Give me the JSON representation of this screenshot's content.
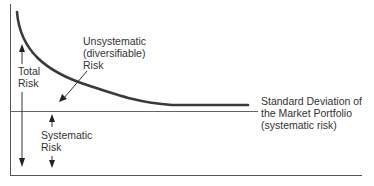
{
  "diagram": {
    "labels": {
      "unsystematic": [
        "Unsystematic",
        "(diversifiable)",
        "Risk"
      ],
      "total": [
        "Total",
        "Risk"
      ],
      "systematic": [
        "Systematic",
        "Risk"
      ],
      "market_sd": [
        "Standard Deviation of",
        "the Market Portfolio",
        "(systematic risk)"
      ]
    },
    "colors": {
      "curve": "#3a3a3a",
      "axes": "#555555",
      "text": "#333333"
    }
  }
}
